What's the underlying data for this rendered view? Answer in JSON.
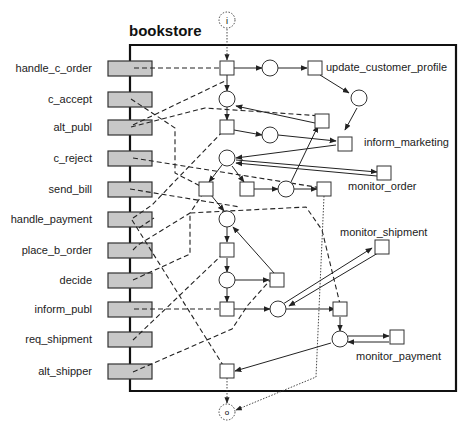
{
  "diagram": {
    "title": "bookstore",
    "type": "workflow-net",
    "start_place": "i",
    "end_place": "o",
    "interface_tasks": [
      {
        "label": "handle_c_order",
        "y": 68
      },
      {
        "label": "c_accept",
        "y": 99
      },
      {
        "label": "alt_publ",
        "y": 127
      },
      {
        "label": "c_reject",
        "y": 158
      },
      {
        "label": "send_bill",
        "y": 189
      },
      {
        "label": "handle_payment",
        "y": 220
      },
      {
        "label": "place_b_order",
        "y": 250
      },
      {
        "label": "decide",
        "y": 280
      },
      {
        "label": "inform_publ",
        "y": 310
      },
      {
        "label": "req_shipment",
        "y": 340
      },
      {
        "label": "alt_shipper",
        "y": 372
      }
    ],
    "named_transitions": [
      {
        "label": "update_customer_profile"
      },
      {
        "label": "inform_marketing"
      },
      {
        "label": "monitor_order"
      },
      {
        "label": "monitor_shipment"
      },
      {
        "label": "monitor_payment"
      }
    ],
    "colors": {
      "frame": "#111111",
      "task_fill": "#c8c8c8",
      "task_stroke": "#333333",
      "line": "#222222"
    }
  }
}
